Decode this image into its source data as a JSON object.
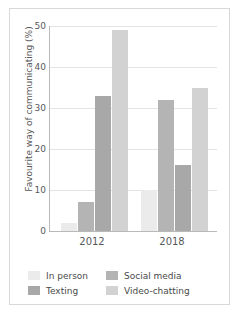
{
  "chart_data": {
    "type": "bar",
    "title": "",
    "xlabel": "",
    "ylabel": "Favourite way of communicating (%)",
    "categories": [
      "2012",
      "2018"
    ],
    "ylim": [
      0,
      50
    ],
    "yticks": [
      "0",
      "10",
      "20",
      "30",
      "40",
      "50"
    ],
    "grid": true,
    "legend_position": "bottom",
    "series": [
      {
        "name": "In person",
        "values": [
          2,
          10
        ],
        "color": "#ebebeb"
      },
      {
        "name": "Social media",
        "values": [
          7,
          32
        ],
        "color": "#b4b4b4"
      },
      {
        "name": "Texting",
        "values": [
          33,
          16
        ],
        "color": "#a8a8a8"
      },
      {
        "name": "Video-chatting",
        "values": [
          49,
          35
        ],
        "color": "#d2d2d2"
      }
    ]
  },
  "legend": {
    "items": [
      {
        "label": "In person",
        "color": "#ebebeb"
      },
      {
        "label": "Social media",
        "color": "#b4b4b4"
      },
      {
        "label": "Texting",
        "color": "#a8a8a8"
      },
      {
        "label": "Video-chatting",
        "color": "#d2d2d2"
      }
    ]
  },
  "axis": {
    "y_title": "Favourite way of communicating (%)",
    "y_labels": [
      "50",
      "40",
      "30",
      "20",
      "10",
      "0"
    ],
    "x_labels": [
      "2012",
      "2018"
    ]
  },
  "colors": {
    "gridline": "#e3e3e3",
    "axis": "#b9b9b9",
    "frame": "#d8d8d8",
    "text": "#58595b",
    "background": "#ffffff"
  }
}
